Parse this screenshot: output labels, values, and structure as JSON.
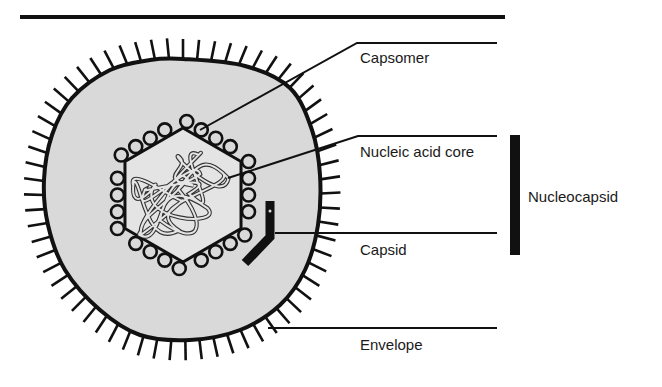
{
  "colors": {
    "ink": "#111111",
    "fill": "#d9d9d9",
    "inner_fill": "#e4e4e4",
    "background": "#ffffff"
  },
  "top_rule": {
    "x1": 20,
    "x2": 505,
    "y": 17,
    "width": 4
  },
  "labels": {
    "capsomer": "Capsomer",
    "nucleic_acid_core": "Nucleic acid core",
    "capsid": "Capsid",
    "envelope": "Envelope",
    "nucleocapsid": "Nucleocapsid"
  },
  "leaders": {
    "capsomer": {
      "points": [
        [
          200,
          130
        ],
        [
          357,
          43
        ],
        [
          497,
          43
        ]
      ],
      "label_x": 360,
      "label_y": 50
    },
    "nucleic_acid_core": {
      "points": [
        [
          228,
          178
        ],
        [
          358,
          136
        ],
        [
          497,
          136
        ]
      ],
      "label_x": 360,
      "label_y": 144
    },
    "capsid": {
      "points": [
        [
          275,
          233
        ],
        [
          497,
          233
        ]
      ],
      "label_x": 360,
      "label_y": 242
    },
    "envelope": {
      "points": [
        [
          268,
          328
        ],
        [
          497,
          328
        ]
      ],
      "label_x": 360,
      "label_y": 337
    }
  },
  "nucleocapsid_bracket": {
    "x": 510,
    "y": 135,
    "width": 10,
    "height": 120,
    "label_x": 528,
    "label_y": 189
  },
  "capsid_marker": {
    "points": [
      [
        270,
        201
      ],
      [
        270,
        237
      ],
      [
        245,
        263
      ]
    ],
    "width": 9
  },
  "envelope_shape": {
    "outline": [
      [
        183,
        59
      ],
      [
        245,
        66
      ],
      [
        290,
        88
      ],
      [
        312,
        130
      ],
      [
        320,
        175
      ],
      [
        318,
        225
      ],
      [
        305,
        270
      ],
      [
        280,
        305
      ],
      [
        240,
        330
      ],
      [
        190,
        340
      ],
      [
        140,
        335
      ],
      [
        100,
        310
      ],
      [
        65,
        270
      ],
      [
        48,
        225
      ],
      [
        44,
        180
      ],
      [
        52,
        135
      ],
      [
        72,
        98
      ],
      [
        110,
        70
      ],
      [
        150,
        60
      ]
    ],
    "spike_count": 64,
    "spike_length": 20
  },
  "hexagon": {
    "cx": 183,
    "cy": 195,
    "r": 67
  },
  "capsomers": {
    "count_per_side": 4,
    "radius": 6.5
  },
  "core_coil": {
    "cx": 183,
    "cy": 195,
    "loops": 9
  }
}
